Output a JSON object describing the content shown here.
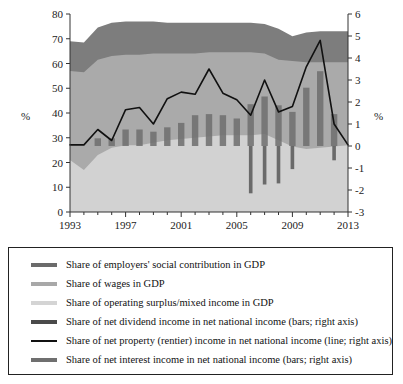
{
  "chart_data": {
    "type": "area",
    "title": "",
    "xlabel": "",
    "ylabel": "%",
    "ylabel_right": "%",
    "x": [
      1993,
      1994,
      1995,
      1996,
      1997,
      1998,
      1999,
      2000,
      2001,
      2002,
      2003,
      2004,
      2005,
      2006,
      2007,
      2008,
      2009,
      2010,
      2011,
      2012,
      2013
    ],
    "xlim": [
      1993,
      2013
    ],
    "xtick_labels": [
      "1993",
      "1997",
      "2001",
      "2005",
      "2009",
      "2013"
    ],
    "xtick_values": [
      1993,
      1997,
      2001,
      2005,
      2009,
      2013
    ],
    "ylim": [
      0,
      80
    ],
    "ytick_labels": [
      "0",
      "10",
      "20",
      "30",
      "40",
      "50",
      "60",
      "70",
      "80"
    ],
    "ytick_values": [
      0,
      10,
      20,
      30,
      40,
      50,
      60,
      70,
      80
    ],
    "ylim_right": [
      -3,
      6
    ],
    "ytick_labels_right": [
      "-3",
      "-2",
      "-1",
      "0",
      "1",
      "2",
      "3",
      "4",
      "5",
      "6"
    ],
    "ytick_values_right": [
      -3,
      -2,
      -1,
      0,
      1,
      2,
      3,
      4,
      5,
      6
    ],
    "grid": false,
    "legend_position": "below-plot",
    "series": [
      {
        "name": "Share of operating surplus/mixed income in GDP",
        "type": "area",
        "stack_order": 1,
        "axis": "left",
        "color": "#d2d2d2",
        "values": [
          21.0,
          17.0,
          23.0,
          26.0,
          27.0,
          27.0,
          28.0,
          29.0,
          29.5,
          30.0,
          30.5,
          31.0,
          31.0,
          31.0,
          31.5,
          29.0,
          26.5,
          25.5,
          26.0,
          26.5,
          27.0
        ]
      },
      {
        "name": "Share of wages in GDP",
        "type": "area",
        "stack_order": 2,
        "axis": "left",
        "color": "#aaaaaa",
        "values": [
          36.0,
          39.5,
          38.5,
          37.0,
          36.5,
          36.5,
          36.0,
          35.0,
          34.5,
          34.0,
          34.0,
          33.5,
          33.5,
          33.5,
          32.5,
          32.5,
          34.5,
          35.0,
          34.5,
          34.0,
          33.5
        ]
      },
      {
        "name": "Share of employers' social contribution in GDP",
        "type": "area",
        "stack_order": 3,
        "axis": "left",
        "color": "#7d7d7d",
        "values": [
          12.0,
          12.0,
          13.0,
          13.5,
          13.5,
          13.5,
          13.0,
          12.5,
          12.5,
          12.5,
          12.0,
          12.0,
          12.0,
          12.0,
          12.0,
          12.5,
          10.0,
          12.0,
          12.5,
          12.5,
          12.5
        ]
      },
      {
        "name": "Share of net dividend income in net national income (bars; right axis)",
        "type": "bar",
        "axis": "right",
        "color": "#6f6f6f",
        "values": [
          0.0,
          0.0,
          0.35,
          0.35,
          0.75,
          0.75,
          0.65,
          0.85,
          1.05,
          1.4,
          1.45,
          1.4,
          1.25,
          1.9,
          2.25,
          1.85,
          1.55,
          2.65,
          3.4,
          1.45,
          0.0
        ]
      },
      {
        "name": "Share of net interest income in net national income (bars; right axis)",
        "type": "bar",
        "axis": "right",
        "color": "#585858",
        "values": [
          0.0,
          0.0,
          0.0,
          0.0,
          0.0,
          0.0,
          0.0,
          0.0,
          0.0,
          0.0,
          0.0,
          0.0,
          0.0,
          -2.15,
          -1.75,
          -1.7,
          -1.05,
          0.0,
          0.0,
          -0.65,
          0.0
        ]
      },
      {
        "name": "Share of net property (rentier) income in net national income (line; right axis)",
        "type": "line",
        "axis": "right",
        "color": "#111111",
        "values": [
          0.05,
          0.05,
          0.75,
          0.25,
          1.65,
          1.75,
          1.0,
          2.15,
          2.45,
          2.35,
          3.5,
          2.4,
          2.1,
          1.4,
          3.0,
          1.55,
          1.8,
          3.6,
          4.8,
          1.0,
          0.05
        ]
      }
    ]
  },
  "axes": {
    "left_unit": "%",
    "right_unit": "%"
  },
  "legend": {
    "items": [
      {
        "label": "Share of employers' social contribution in GDP",
        "color": "#6b6b6b",
        "style": "thick",
        "swatch_name": "legend-swatch-employers-social-contribution"
      },
      {
        "label": "Share of wages in GDP",
        "color": "#a8a8a8",
        "style": "thick",
        "swatch_name": "legend-swatch-wages"
      },
      {
        "label": "Share of operating surplus/mixed income in GDP",
        "color": "#d4d4d4",
        "style": "thick",
        "swatch_name": "legend-swatch-operating-surplus"
      },
      {
        "label": "Share of net dividend income in net national income (bars; right axis)",
        "color": "#4a4a4a",
        "style": "thick",
        "swatch_name": "legend-swatch-net-dividend"
      },
      {
        "label": "Share of net property (rentier) income in net national income (line; right axis)",
        "color": "#111111",
        "style": "thin",
        "swatch_name": "legend-swatch-net-property"
      },
      {
        "label": "Share of net interest income in net national income (bars; right axis)",
        "color": "#6f6f6f",
        "style": "thick",
        "swatch_name": "legend-swatch-net-interest"
      }
    ]
  }
}
